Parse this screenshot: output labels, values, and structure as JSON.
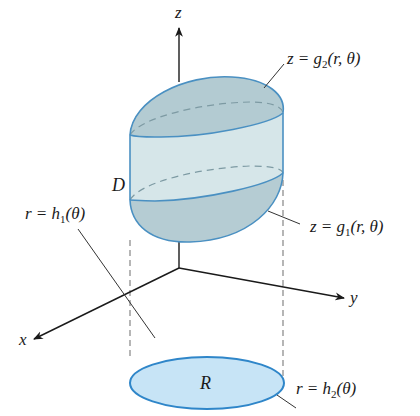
{
  "figure": {
    "type": "3d-solid-cylindrical-coordinates",
    "colors": {
      "outline": "#4a90c2",
      "solid_fill": "#c4d9df",
      "cap_fill": "#aec7ce",
      "side_fill": "#d3e3e6",
      "region_fill": "#c7e4f6",
      "region_outline": "#2f86c9",
      "axis": "#1a1a1a",
      "leader": "#333333",
      "dashed": "#7a7a7a"
    },
    "axes": {
      "z_label": "z",
      "y_label": "y",
      "x_label": "x"
    },
    "labels": {
      "solid": "D",
      "region": "R",
      "top_surface": {
        "lhs": "z = g",
        "sub": "2",
        "rhs": "(r, θ)"
      },
      "bottom_surface": {
        "lhs": "z = g",
        "sub": "1",
        "rhs": "(r, θ)"
      },
      "inner_boundary": {
        "lhs": "r = h",
        "sub": "1",
        "rhs": "(θ)"
      },
      "outer_boundary": {
        "lhs": "r = h",
        "sub": "2",
        "rhs": "(θ)"
      }
    }
  }
}
